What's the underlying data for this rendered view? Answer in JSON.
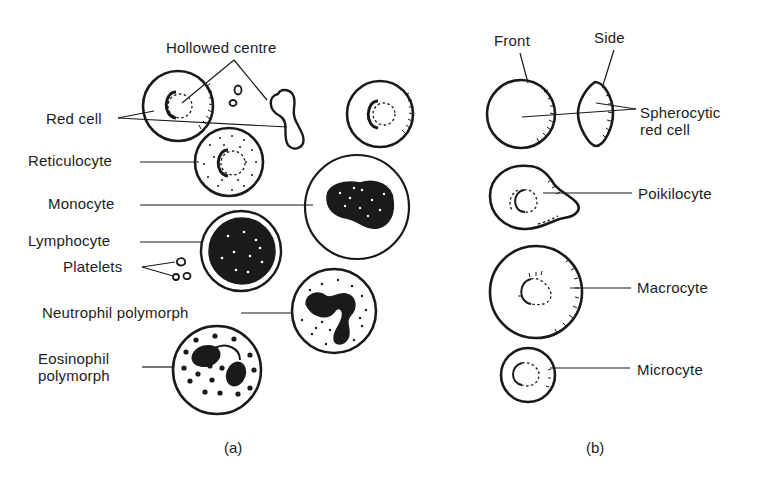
{
  "figure": {
    "panel_a": {
      "caption": "(a)",
      "labels": {
        "hollowed_centre": "Hollowed centre",
        "red_cell": "Red cell",
        "reticulocyte": "Reticulocyte",
        "monocyte": "Monocyte",
        "lymphocyte": "Lymphocyte",
        "platelets": "Platelets",
        "neutrophil": "Neutrophil polymorph",
        "eosinophil_line1": "Eosinophil",
        "eosinophil_line2": "polymorph"
      }
    },
    "panel_b": {
      "caption": "(b)",
      "labels": {
        "front": "Front",
        "side": "Side",
        "spherocytic_line1": "Spherocytic",
        "spherocytic_line2": "red cell",
        "poikilocyte": "Poikilocyte",
        "macrocyte": "Macrocyte",
        "microcyte": "Microcyte"
      }
    },
    "colors": {
      "ink": "#1a1a1a",
      "background": "#ffffff"
    }
  }
}
